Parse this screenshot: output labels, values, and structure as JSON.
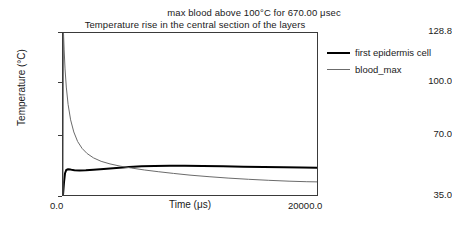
{
  "chart_data": {
    "type": "line",
    "title": "Temperature rise in the central section of the layers",
    "annotation": "max blood above 100°C for 670.00 μsec",
    "xlabel": "Time (μs)",
    "ylabel": "Temperature (°C)",
    "xlim": [
      0.0,
      20000.0
    ],
    "ylim": [
      35.0,
      128.8
    ],
    "xticks": [
      "0.0",
      "20000.0"
    ],
    "xtick_values": [
      0.0,
      20000.0
    ],
    "yticks": [
      "128.8",
      "100.0",
      "70.0",
      "35.0"
    ],
    "ytick_values": [
      128.8,
      100.0,
      70.0,
      35.0
    ],
    "grid": false,
    "legend_position": "right-outside",
    "series": [
      {
        "name": "first epidermis cell",
        "color": "#000000",
        "width": 2,
        "x": [
          0,
          80,
          160,
          260,
          400,
          600,
          900,
          1300,
          1800,
          2400,
          3200,
          4200,
          5200,
          6200,
          7200,
          8400,
          9600,
          11000,
          12600,
          14200,
          15800,
          17400,
          18800,
          20000
        ],
        "y": [
          35.0,
          42.5,
          47.6,
          49.5,
          49.9,
          49.7,
          49.3,
          49.2,
          49.3,
          49.6,
          50.1,
          50.7,
          51.2,
          51.6,
          51.8,
          51.9,
          51.9,
          51.8,
          51.6,
          51.4,
          51.2,
          51.0,
          50.9,
          50.8
        ]
      },
      {
        "name": "blood_max",
        "color": "#6b6b6b",
        "width": 1,
        "x": [
          0,
          40,
          90,
          160,
          260,
          400,
          600,
          850,
          1150,
          1500,
          1900,
          2400,
          3000,
          3700,
          4500,
          5400,
          6400,
          7500,
          8700,
          10000,
          11500,
          13000,
          14600,
          16200,
          17800,
          19200,
          20000
        ],
        "y": [
          35.0,
          128.8,
          119.0,
          108.0,
          97.5,
          87.5,
          78.5,
          71.5,
          66.0,
          62.0,
          59.0,
          56.5,
          54.5,
          53.0,
          51.7,
          50.6,
          49.5,
          48.5,
          47.5,
          46.5,
          45.6,
          44.8,
          44.1,
          43.5,
          43.0,
          42.7,
          42.6
        ]
      }
    ]
  },
  "legend": {
    "items": [
      {
        "label": "first epidermis cell",
        "style": "thick"
      },
      {
        "label": "blood_max",
        "style": "thin"
      }
    ]
  }
}
